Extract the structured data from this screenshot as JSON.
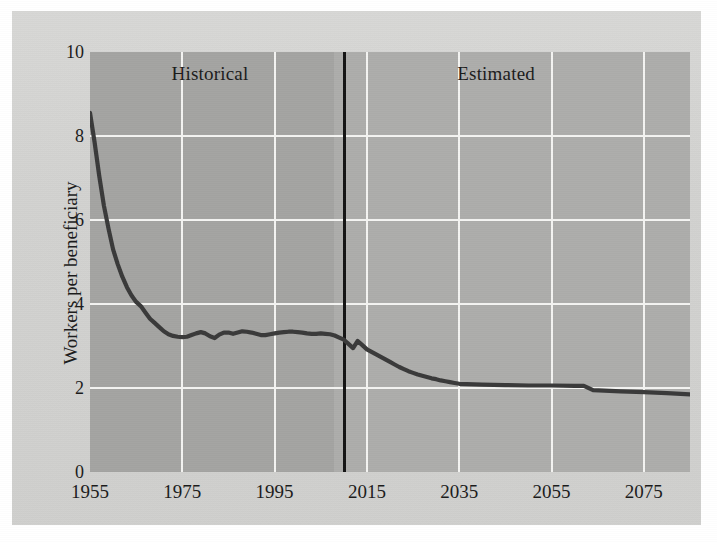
{
  "figure": {
    "paper_color": "#d3d3d1",
    "plot_color": "#a9a9a7",
    "grid_color": "#f4f4f2",
    "line_color": "#3a3a3a",
    "divider_color": "#141414"
  },
  "chart_data": {
    "type": "line",
    "title": "",
    "xlabel": "",
    "ylabel": "Workers per beneficiary",
    "xlim": [
      1955,
      2085
    ],
    "ylim": [
      0,
      10
    ],
    "grid": true,
    "legend": "none",
    "xticks": [
      1955,
      1975,
      1995,
      2015,
      2035,
      2055,
      2075
    ],
    "xticklabels": [
      "1955",
      "1975",
      "1995",
      "2015",
      "2035",
      "2055",
      "2075"
    ],
    "yticks": [
      0,
      2,
      4,
      6,
      8,
      10
    ],
    "yticklabels": [
      "0",
      "2",
      "4",
      "6",
      "8",
      "10"
    ],
    "annotations": [
      {
        "text": "Historical",
        "x": 1981,
        "y": 9.45
      },
      {
        "text": "Estimated",
        "x": 2043,
        "y": 9.45
      }
    ],
    "divider": {
      "x": 2010,
      "label": "historical/estimated boundary"
    },
    "series": [
      {
        "name": "Workers per beneficiary",
        "x": [
          1955,
          1956,
          1957,
          1958,
          1959,
          1960,
          1961,
          1962,
          1963,
          1964,
          1965,
          1966,
          1967,
          1968,
          1969,
          1970,
          1971,
          1972,
          1973,
          1974,
          1975,
          1976,
          1977,
          1978,
          1979,
          1980,
          1981,
          1982,
          1983,
          1984,
          1985,
          1986,
          1987,
          1988,
          1989,
          1990,
          1991,
          1992,
          1993,
          1994,
          1995,
          1996,
          1997,
          1998,
          1999,
          2000,
          2001,
          2002,
          2003,
          2004,
          2005,
          2006,
          2007,
          2008,
          2009,
          2010,
          2011,
          2012,
          2013,
          2014,
          2015,
          2016,
          2017,
          2018,
          2019,
          2020,
          2021,
          2022,
          2023,
          2024,
          2025,
          2026,
          2027,
          2028,
          2029,
          2030,
          2031,
          2032,
          2033,
          2034,
          2035,
          2040,
          2045,
          2050,
          2055,
          2060,
          2062,
          2064,
          2070,
          2075,
          2080,
          2085
        ],
        "y": [
          8.55,
          7.85,
          7.05,
          6.35,
          5.8,
          5.3,
          4.95,
          4.65,
          4.4,
          4.2,
          4.05,
          3.95,
          3.8,
          3.65,
          3.55,
          3.45,
          3.35,
          3.28,
          3.24,
          3.22,
          3.21,
          3.22,
          3.26,
          3.3,
          3.33,
          3.3,
          3.23,
          3.19,
          3.27,
          3.32,
          3.32,
          3.29,
          3.32,
          3.35,
          3.34,
          3.32,
          3.29,
          3.26,
          3.26,
          3.28,
          3.3,
          3.32,
          3.33,
          3.34,
          3.34,
          3.33,
          3.32,
          3.3,
          3.29,
          3.29,
          3.3,
          3.29,
          3.28,
          3.25,
          3.2,
          3.15,
          3.05,
          2.95,
          3.12,
          3.02,
          2.92,
          2.86,
          2.8,
          2.74,
          2.68,
          2.62,
          2.56,
          2.5,
          2.45,
          2.4,
          2.36,
          2.32,
          2.29,
          2.26,
          2.23,
          2.21,
          2.18,
          2.16,
          2.14,
          2.12,
          2.1,
          2.08,
          2.07,
          2.06,
          2.06,
          2.05,
          2.05,
          1.95,
          1.92,
          1.9,
          1.88,
          1.85
        ]
      }
    ]
  }
}
